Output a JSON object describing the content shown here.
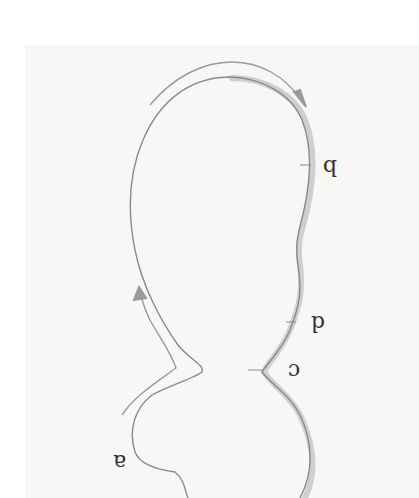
{
  "figure": {
    "labels": {
      "a": "a",
      "b": "b",
      "c": "c",
      "d": "d"
    },
    "colors": {
      "outline": "#8a8a8a",
      "highlight_edge": "#c8c8c8",
      "arrow": "#9a9a9a",
      "label": "#333333",
      "background": "#f7f7f6"
    }
  }
}
